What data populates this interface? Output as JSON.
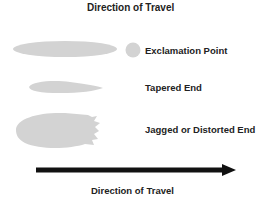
{
  "diagram": {
    "title": "Direction of Travel",
    "items": [
      {
        "label": "Exclamation Point",
        "shape": "elongated-ellipse-with-dot"
      },
      {
        "label": "Tapered End",
        "shape": "tapered-teardrop"
      },
      {
        "label": "Jagged or Distorted End",
        "shape": "jagged-oval"
      }
    ],
    "arrow_label": "Direction of Travel",
    "colors": {
      "shape_fill": "#d3d3d3",
      "arrow": "#111111",
      "text": "#222222"
    }
  }
}
